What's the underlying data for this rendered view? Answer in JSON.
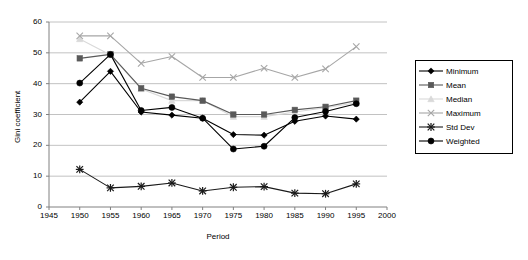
{
  "chart_data": {
    "type": "line",
    "title": "",
    "xlabel": "Period",
    "ylabel": "Gini coefficient",
    "xlim": [
      1945,
      2000
    ],
    "ylim": [
      0,
      60
    ],
    "xticks": [
      1945,
      1950,
      1955,
      1960,
      1965,
      1970,
      1975,
      1980,
      1985,
      1990,
      1995,
      2000
    ],
    "yticks": [
      0,
      10,
      20,
      30,
      40,
      50,
      60
    ],
    "grid": "horizontal",
    "legend_position": "right",
    "x": [
      1950,
      1955,
      1960,
      1965,
      1970,
      1975,
      1980,
      1985,
      1990,
      1995
    ],
    "series": [
      {
        "name": "Minimum",
        "marker": "diamond",
        "color": "#000000",
        "values": [
          34.0,
          44.0,
          30.8,
          29.8,
          28.8,
          23.5,
          23.3,
          27.8,
          29.5,
          28.5
        ]
      },
      {
        "name": "Mean",
        "marker": "square",
        "color": "#595959",
        "values": [
          48.2,
          49.5,
          38.5,
          35.8,
          34.5,
          30.0,
          30.0,
          31.5,
          32.5,
          34.5
        ]
      },
      {
        "name": "Median",
        "marker": "triangle",
        "color": "#d9d9d9",
        "values": [
          54.5,
          49.3,
          38.3,
          34.5,
          34.5,
          29.3,
          29.3,
          30.8,
          32.2,
          33.8
        ]
      },
      {
        "name": "Maximum",
        "marker": "cross",
        "color": "#a6a6a6",
        "values": [
          55.5,
          55.5,
          46.6,
          48.8,
          42.0,
          42.0,
          45.0,
          42.0,
          44.8,
          52.0
        ]
      },
      {
        "name": "Std Dev",
        "marker": "asterisk",
        "color": "#1a1a1a",
        "values": [
          12.2,
          6.2,
          6.7,
          7.8,
          5.2,
          6.4,
          6.6,
          4.5,
          4.3,
          7.5
        ]
      },
      {
        "name": "Weighted",
        "marker": "circle",
        "color": "#000000",
        "values": [
          40.2,
          49.5,
          31.3,
          32.3,
          28.8,
          18.8,
          19.7,
          29.0,
          31.0,
          33.5
        ]
      }
    ]
  },
  "axes": {
    "y_title": "Gini coefficient",
    "x_title": "Period",
    "y_tick_labels": [
      "0",
      "10",
      "20",
      "30",
      "40",
      "50",
      "60"
    ],
    "x_tick_labels": [
      "1945",
      "1950",
      "1955",
      "1960",
      "1965",
      "1970",
      "1975",
      "1980",
      "1985",
      "1990",
      "1995",
      "2000"
    ]
  },
  "legend": {
    "items": [
      {
        "label": "Minimum"
      },
      {
        "label": "Mean"
      },
      {
        "label": "Median"
      },
      {
        "label": "Maximum"
      },
      {
        "label": "Std Dev"
      },
      {
        "label": "Weighted"
      }
    ]
  }
}
